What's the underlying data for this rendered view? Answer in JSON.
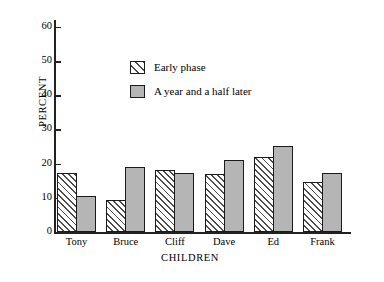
{
  "chart_data": {
    "type": "bar",
    "title": "",
    "subtitle": "",
    "xlabel": "CHILDREN",
    "ylabel": "PERCENT",
    "categories": [
      "Tony",
      "Bruce",
      "Cliff",
      "Dave",
      "Ed",
      "Frank"
    ],
    "series": [
      {
        "name": "Early phase",
        "values": [
          17.2,
          9.5,
          18.0,
          17.0,
          22.0,
          14.5
        ],
        "fill": "hatched-diagonal",
        "color": "#ffffff",
        "hatch_color": "#4a4a4a",
        "border_color": "#1a1a1a"
      },
      {
        "name": "A year and a half later",
        "values": [
          10.5,
          19.0,
          17.2,
          21.2,
          25.2,
          17.2
        ],
        "fill": "solid",
        "color": "#b5b5b5",
        "border_color": "#1a1a1a"
      }
    ],
    "ylim": [
      0,
      62
    ],
    "yticks": [
      0,
      10,
      20,
      30,
      40,
      50,
      60
    ],
    "ytick_labels": [
      "0",
      "10",
      "20",
      "30",
      "40",
      "50",
      "60"
    ],
    "grid": false,
    "legend_position": "upper-center",
    "tick_direction": "in",
    "spines": [
      "left",
      "bottom"
    ],
    "background": "#ffffff"
  },
  "axes": {
    "y_label": "PERCENT",
    "x_label": "CHILDREN"
  },
  "legend": {
    "entries": [
      {
        "label": "Early phase",
        "swatch": "hatched-swatch-icon"
      },
      {
        "label": "A year and a half later",
        "swatch": "solid-gray-swatch-icon"
      }
    ]
  }
}
